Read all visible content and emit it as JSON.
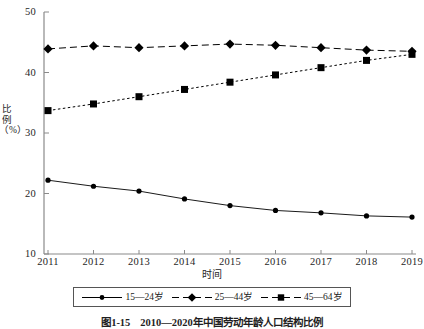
{
  "chart_data": {
    "type": "line",
    "title": "",
    "xlabel": "时间",
    "ylabel": "比例（%）",
    "categories": [
      "2011",
      "2012",
      "2013",
      "2014",
      "2015",
      "2016",
      "2017",
      "2018",
      "2019"
    ],
    "x": [
      2011,
      2012,
      2013,
      2014,
      2015,
      2016,
      2017,
      2018,
      2019
    ],
    "ylim": [
      10,
      50
    ],
    "xlim": [
      2011,
      2019
    ],
    "y_ticks": [
      10,
      20,
      30,
      40,
      50
    ],
    "grid": false,
    "legend_position": "below-axes",
    "series": [
      {
        "name": "15—24岁",
        "marker": "circle",
        "line_style": "solid",
        "color": "#000000",
        "values": [
          22.2,
          21.2,
          20.4,
          19.1,
          18.0,
          17.2,
          16.8,
          16.3,
          16.1
        ]
      },
      {
        "name": "25—44岁",
        "marker": "diamond",
        "line_style": "dashed",
        "color": "#000000",
        "values": [
          43.9,
          44.4,
          44.1,
          44.4,
          44.7,
          44.5,
          44.1,
          43.7,
          43.5
        ]
      },
      {
        "name": "45—64岁",
        "marker": "square",
        "line_style": "dotted",
        "color": "#000000",
        "values": [
          33.7,
          34.8,
          36.0,
          37.2,
          38.4,
          39.6,
          40.8,
          42.0,
          43.0
        ]
      }
    ]
  },
  "axes": {
    "y_tick_labels": [
      "50",
      "40",
      "30",
      "20",
      "10"
    ],
    "x_tick_labels": [
      "2011",
      "2012",
      "2013",
      "2014",
      "2015",
      "2016",
      "2017",
      "2018",
      "2019"
    ],
    "y_axis_title": "比例（%）",
    "x_axis_title": "时间"
  },
  "legend": {
    "items": [
      {
        "label": "15—24岁",
        "marker": "circle",
        "line_style": "solid"
      },
      {
        "label": "25—44岁",
        "marker": "diamond",
        "line_style": "dashed"
      },
      {
        "label": "45—64岁",
        "marker": "square",
        "line_style": "dashed"
      }
    ]
  },
  "caption": {
    "text": "图1-15　2010—2020年中国劳动年龄人口结构比例"
  },
  "colors": {
    "ink": "#000000",
    "axis": "#8a8a8a",
    "background": "#ffffff"
  }
}
